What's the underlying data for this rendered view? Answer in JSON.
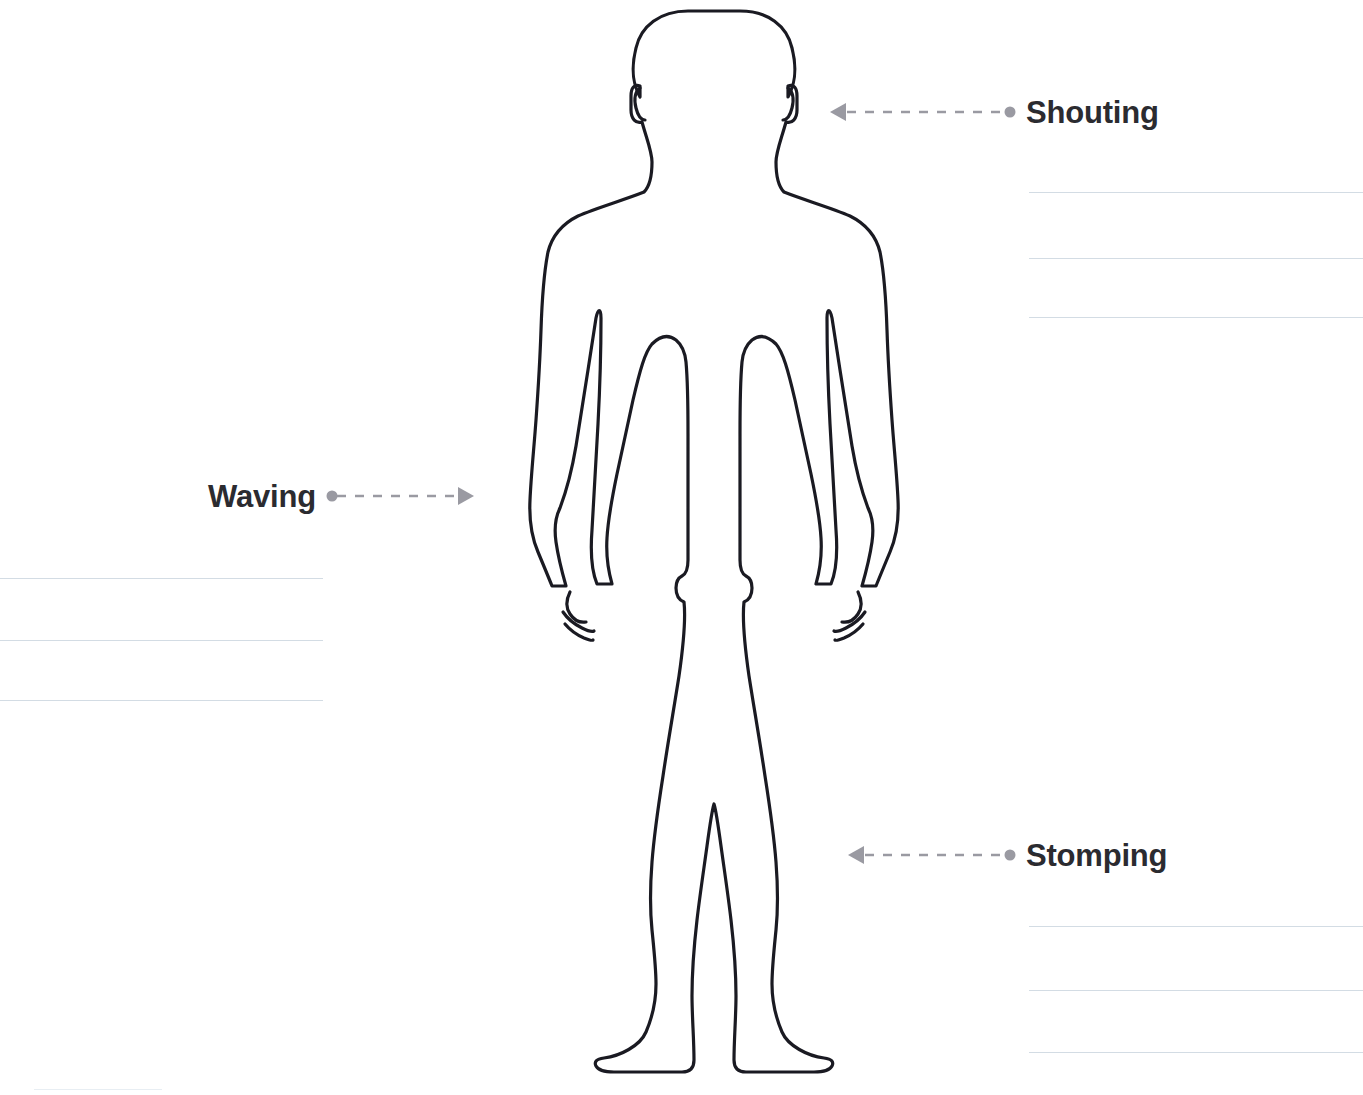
{
  "page": {
    "background_color": "#ffffff",
    "width": 1363,
    "height": 1095
  },
  "figure": {
    "name": "human-body-outline",
    "stroke_color": "#1a1a22",
    "fill_color": "#ffffff",
    "stroke_width": 3
  },
  "callouts": [
    {
      "id": "shouting",
      "label": "Shouting",
      "label_side": "right",
      "arrow_direction": "left",
      "connector_color": "#9a9aa2",
      "dot_x": 1010,
      "arrow_tip_x": 830,
      "y": 112,
      "label_x": 1026
    },
    {
      "id": "waving",
      "label": "Waving",
      "label_side": "left",
      "arrow_direction": "right",
      "connector_color": "#9a9aa2",
      "dot_x": 327,
      "arrow_tip_x": 469,
      "y": 496,
      "label_x": 208
    },
    {
      "id": "stomping",
      "label": "Stomping",
      "label_side": "right",
      "arrow_direction": "left",
      "connector_color": "#9a9aa2",
      "dot_x": 1010,
      "arrow_tip_x": 848,
      "y": 855,
      "label_x": 1026
    }
  ],
  "rule_lines": {
    "color": "#d3dce4",
    "groups": [
      {
        "id": "shouting-lines",
        "label_for": "Shouting",
        "left": 1029,
        "width": 334,
        "ys": [
          192,
          258,
          317
        ],
        "faint": false
      },
      {
        "id": "waving-lines",
        "label_for": "Waving",
        "left": 0,
        "width": 323,
        "ys": [
          578,
          640,
          700
        ],
        "faint": false
      },
      {
        "id": "stomping-lines",
        "label_for": "Stomping",
        "left": 1029,
        "width": 334,
        "ys": [
          926,
          990,
          1052
        ],
        "faint": false
      },
      {
        "id": "bottom-left-line",
        "label_for": "",
        "left": 34,
        "width": 128,
        "ys": [
          1089
        ],
        "faint": true
      }
    ]
  }
}
